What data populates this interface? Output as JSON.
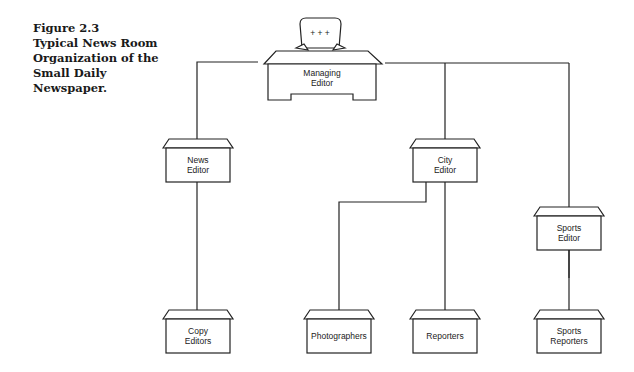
{
  "caption": {
    "number": "Figure 2.3",
    "title": "Typical News Room Organization of the Small Daily Newspaper."
  },
  "nodes": [
    {
      "id": "managing-editor",
      "lines": [
        "Managing",
        "Editor"
      ]
    },
    {
      "id": "news-editor",
      "lines": [
        "News",
        "Editor"
      ]
    },
    {
      "id": "city-editor",
      "lines": [
        "City",
        "Editor"
      ]
    },
    {
      "id": "sports-editor",
      "lines": [
        "Sports",
        "Editor"
      ]
    },
    {
      "id": "copy-editors",
      "lines": [
        "Copy",
        "Editors"
      ]
    },
    {
      "id": "photographers",
      "lines": [
        "Photographers"
      ]
    },
    {
      "id": "reporters",
      "lines": [
        "Reporters"
      ]
    },
    {
      "id": "sports-reporters",
      "lines": [
        "Sports",
        "Reporters"
      ]
    }
  ],
  "edges": [
    [
      "managing-editor",
      "news-editor"
    ],
    [
      "managing-editor",
      "city-editor"
    ],
    [
      "managing-editor",
      "sports-editor"
    ],
    [
      "news-editor",
      "copy-editors"
    ],
    [
      "city-editor",
      "photographers"
    ],
    [
      "city-editor",
      "reporters"
    ],
    [
      "sports-editor",
      "sports-reporters"
    ]
  ],
  "desk_sign": "+ + +"
}
